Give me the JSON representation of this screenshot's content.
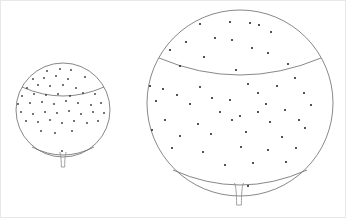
{
  "figure": {
    "title": "",
    "background_color": "#ffffff",
    "width": 346,
    "height": 218,
    "frame": {
      "visible": true,
      "color": "#e8e8e8",
      "x": 0.5,
      "y": 0.5,
      "width": 345,
      "height": 217
    }
  },
  "chart_data": {
    "type": "scatter",
    "title": "",
    "subtitle": "",
    "xlabel": "",
    "ylabel": "",
    "grid": false,
    "legend_position": "none",
    "marker": {
      "shape": "square",
      "color": "#2b2b2b",
      "size_small_px": 1.6,
      "size_large_px": 1.8
    },
    "line_color": "#6a6a6a",
    "objects": [
      {
        "name": "small-sphere",
        "label": "small balloon",
        "center_x": 63,
        "center_y": 110,
        "radius": 47,
        "latitude_upper": {
          "y": 87,
          "half_width": 41,
          "arc_depth": 9,
          "direction": "down"
        },
        "latitude_lower": {
          "y": 147,
          "half_width": 31,
          "arc_depth": 8,
          "direction": "down"
        },
        "stem": {
          "x": 63,
          "top_y": 152,
          "bottom_y": 167,
          "flare_half_width": 3.2,
          "neck_half_width": 1.7
        },
        "point_count": 46,
        "points": [
          [
            47,
            71
          ],
          [
            60,
            69
          ],
          [
            71,
            70
          ],
          [
            33,
            79
          ],
          [
            44,
            78
          ],
          [
            56,
            76
          ],
          [
            68,
            79
          ],
          [
            85,
            77
          ],
          [
            27,
            88
          ],
          [
            38,
            85
          ],
          [
            50,
            86
          ],
          [
            63,
            85
          ],
          [
            76,
            88
          ],
          [
            22,
            96
          ],
          [
            34,
            94
          ],
          [
            46,
            95
          ],
          [
            58,
            94
          ],
          [
            70,
            96
          ],
          [
            83,
            93
          ],
          [
            95,
            94
          ],
          [
            18,
            104
          ],
          [
            30,
            103
          ],
          [
            42,
            102
          ],
          [
            54,
            104
          ],
          [
            66,
            101
          ],
          [
            78,
            103
          ],
          [
            91,
            105
          ],
          [
            101,
            103
          ],
          [
            21,
            112
          ],
          [
            33,
            114
          ],
          [
            45,
            112
          ],
          [
            57,
            113
          ],
          [
            69,
            111
          ],
          [
            81,
            114
          ],
          [
            93,
            112
          ],
          [
            104,
            113
          ],
          [
            26,
            121
          ],
          [
            38,
            122
          ],
          [
            50,
            120
          ],
          [
            62,
            123
          ],
          [
            74,
            121
          ],
          [
            87,
            123
          ],
          [
            98,
            121
          ],
          [
            41,
            131
          ],
          [
            55,
            133
          ],
          [
            72,
            131
          ],
          [
            62,
            151
          ]
        ]
      },
      {
        "name": "large-sphere",
        "label": "large balloon",
        "center_x": 240,
        "center_y": 103,
        "radius": 93,
        "latitude_upper": {
          "y": 58,
          "half_width": 81,
          "arc_depth": 17,
          "direction": "down"
        },
        "latitude_lower": {
          "y": 170,
          "half_width": 67,
          "arc_depth": 15,
          "direction": "down"
        },
        "stem": {
          "x": 239,
          "top_y": 183,
          "bottom_y": 205,
          "flare_half_width": 4.5,
          "neck_half_width": 2.4
        },
        "point_count": 52,
        "points": [
          [
            200,
            24
          ],
          [
            230,
            22
          ],
          [
            250,
            23
          ],
          [
            215,
            38
          ],
          [
            271,
            32
          ],
          [
            186,
            42
          ],
          [
            232,
            40
          ],
          [
            252,
            48
          ],
          [
            170,
            50
          ],
          [
            259,
            25
          ],
          [
            204,
            57
          ],
          [
            268,
            53
          ],
          [
            180,
            66
          ],
          [
            236,
            70
          ],
          [
            288,
            64
          ],
          [
            150,
            86
          ],
          [
            163,
            89
          ],
          [
            200,
            87
          ],
          [
            248,
            84
          ],
          [
            277,
            86
          ],
          [
            295,
            78
          ],
          [
            177,
            95
          ],
          [
            212,
            98
          ],
          [
            258,
            93
          ],
          [
            304,
            93
          ],
          [
            156,
            101
          ],
          [
            190,
            104
          ],
          [
            230,
            100
          ],
          [
            266,
            104
          ],
          [
            311,
            105
          ],
          [
            220,
            112
          ],
          [
            240,
            116
          ],
          [
            258,
            112
          ],
          [
            285,
            110
          ],
          [
            165,
            120
          ],
          [
            198,
            124
          ],
          [
            232,
            120
          ],
          [
            270,
            122
          ],
          [
            299,
            120
          ],
          [
            152,
            130
          ],
          [
            180,
            136
          ],
          [
            211,
            134
          ],
          [
            246,
            132
          ],
          [
            282,
            137
          ],
          [
            305,
            128
          ],
          [
            172,
            148
          ],
          [
            203,
            152
          ],
          [
            241,
            147
          ],
          [
            268,
            150
          ],
          [
            296,
            148
          ],
          [
            225,
            165
          ],
          [
            253,
            163
          ],
          [
            286,
            162
          ],
          [
            248,
            186
          ]
        ]
      }
    ]
  }
}
